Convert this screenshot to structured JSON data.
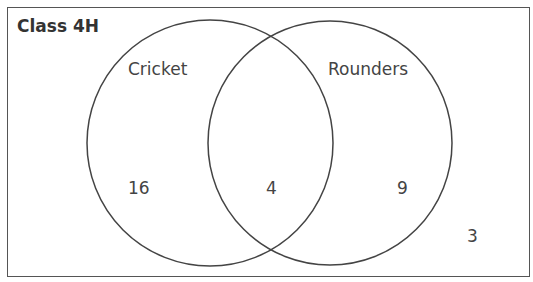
{
  "title": "Class 4H",
  "sets": [
    {
      "name": "Cricket",
      "only_count": "16"
    },
    {
      "name": "Rounders",
      "only_count": "9"
    }
  ],
  "intersection_count": "4",
  "outside_count": "3",
  "colors": {
    "stroke": "#444444",
    "text": "#444444",
    "background": "#ffffff"
  }
}
